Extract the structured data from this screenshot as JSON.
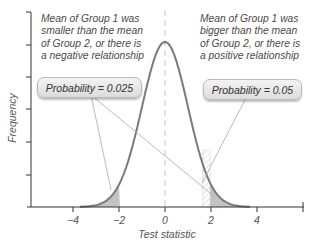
{
  "chart_data": {
    "type": "area",
    "title": "",
    "xlabel": "Test statistic",
    "ylabel": "Frequency",
    "xlim": [
      -5.5,
      5.5
    ],
    "x_ticks": [
      -4,
      -2,
      0,
      2,
      4
    ],
    "x_tick_labels": [
      "−4",
      "−2",
      "0",
      "2",
      "4"
    ],
    "distribution": "standard normal",
    "mean_line_x": 0,
    "shaded_regions": [
      {
        "name": "lower tail",
        "from": -3.7,
        "to": -1.96,
        "probability": 0.025
      },
      {
        "name": "upper tail",
        "from": 1.96,
        "to": 3.7,
        "probability": 0.025
      },
      {
        "name": "one-tailed upper region (hatched)",
        "from": 1.64,
        "to": 3.7,
        "probability": 0.05
      }
    ],
    "grid": false,
    "legend": "none"
  },
  "annotations": {
    "left_note": "Mean of Group 1 was\nsmaller than the mean\nof Group 2, or there is\na negative relationship",
    "right_note": "Mean of Group 1 was\nbigger than the mean\nof Group 2, or there is\na positive relationship",
    "left_box": "Probability = 0.025",
    "right_box": "Probability = 0.05"
  },
  "axes": {
    "xlabel": "Test statistic",
    "ylabel": "Frequency",
    "tick_labels": [
      "−4",
      "−2",
      "0",
      "2",
      "4"
    ]
  },
  "colors": {
    "curve": "#7a7a7a",
    "tail_fill": "#c4c4c4",
    "axis": "#333333",
    "text": "#4a4a4a",
    "connector": "#a0a0a0"
  }
}
